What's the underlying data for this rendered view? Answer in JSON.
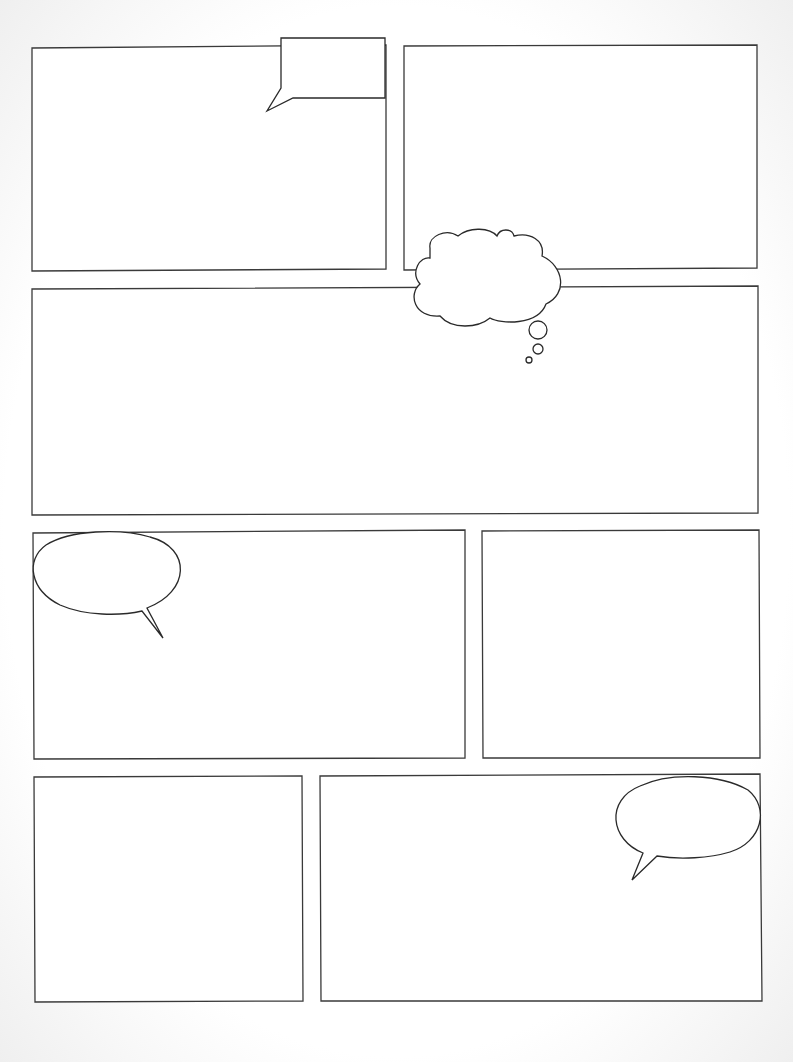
{
  "page": {
    "type": "blank-comic-template",
    "background": "#ffffff",
    "stroke": "#333333"
  },
  "panels": [
    {
      "id": "panel-1",
      "points": "32,48 386,45 386,269 32,271"
    },
    {
      "id": "panel-2",
      "points": "404,46 757,45 757,268 404,270"
    },
    {
      "id": "panel-3",
      "points": "32,289 758,286 758,513 32,515"
    },
    {
      "id": "panel-4",
      "points": "33,533 465,530 465,758 34,759"
    },
    {
      "id": "panel-5",
      "points": "482,531 759,530 760,758 483,758"
    },
    {
      "id": "panel-6",
      "points": "34,777 302,776 303,1001 35,1002"
    },
    {
      "id": "panel-7",
      "points": "320,776 760,774 762,1001 321,1001"
    }
  ],
  "bubbles": [
    {
      "id": "caption-box-bubble",
      "kind": "rect-speech",
      "path": "M281,38 L385,38 L385,98 L293,98 L267,111 L281,88 Z"
    },
    {
      "id": "thought-bubble",
      "kind": "thought",
      "path": "M430,248 C428,236 446,228 458,236 C470,226 490,228 497,236 C500,228 512,228 514,236 C530,232 545,240 542,256 C564,266 568,294 546,304 C538,326 500,324 490,318 C478,328 452,330 440,316 C414,318 408,294 420,284 C410,272 420,256 430,258 Z",
      "dots": [
        {
          "cx": 538,
          "cy": 330,
          "r": 9
        },
        {
          "cx": 538,
          "cy": 349,
          "r": 5
        },
        {
          "cx": 529,
          "cy": 360,
          "r": 3
        }
      ]
    },
    {
      "id": "speech-bubble-left",
      "kind": "oval-speech",
      "path": "M147,608 C190,592 192,548 150,537 C120,528 70,530 46,545 C25,560 30,590 60,605 C85,616 120,616 142,611 L163,638 Z"
    },
    {
      "id": "speech-bubble-right",
      "kind": "oval-speech",
      "path": "M643,853 C610,840 605,800 640,786 C670,772 720,774 748,790 C770,808 762,842 730,852 C710,858 680,860 657,856 L632,880 Z"
    }
  ]
}
